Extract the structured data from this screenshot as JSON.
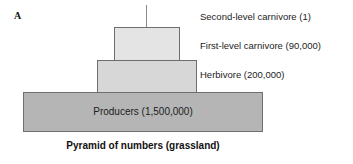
{
  "figure": {
    "panel_letter": "A",
    "caption": "Pyramid of numbers (grassland)"
  },
  "chart_data": {
    "type": "bar",
    "title": "Pyramid of numbers (grassland)",
    "orientation": "pyramid",
    "xlabel": "",
    "ylabel": "Trophic level",
    "categories": [
      "Second-level carnivore",
      "First-level carnivore",
      "Herbivore",
      "Producers"
    ],
    "values": [
      1,
      90000,
      200000,
      1500000
    ],
    "value_labels": [
      "1",
      "90,000",
      "200,000",
      "1,500,000"
    ],
    "legend": "none",
    "grid": false
  },
  "tiers": [
    {
      "key": "second-level-carnivore",
      "name": "Second-level carnivore",
      "count": "1",
      "annotation": "Second-level carnivore (1)",
      "in_box_label": "",
      "fill": "#8a8a8a"
    },
    {
      "key": "first-level-carnivore",
      "name": "First-level carnivore",
      "count": "90,000",
      "annotation": "First-level carnivore (90,000)",
      "in_box_label": "",
      "fill": "#e4e4e4"
    },
    {
      "key": "herbivore",
      "name": "Herbivore",
      "count": "200,000",
      "annotation": "Herbivore (200,000)",
      "in_box_label": "",
      "fill": "#d7d7d7"
    },
    {
      "key": "producers",
      "name": "Producers",
      "count": "1,500,000",
      "annotation": "",
      "in_box_label": "Producers (1,500,000)",
      "fill": "#b5b5b5"
    }
  ],
  "colors": {
    "outline": "#6e6e6e",
    "text": "#1c1c1c",
    "background": "#ffffff"
  }
}
